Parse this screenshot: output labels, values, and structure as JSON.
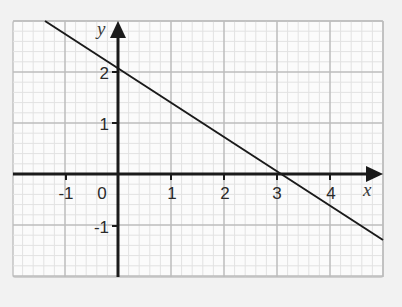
{
  "chart_data": {
    "type": "line",
    "title": "",
    "xlabel": "x",
    "ylabel": "y",
    "xlim": [
      -2,
      5
    ],
    "ylim": [
      -2,
      3
    ],
    "grid": true,
    "grid_minor_divisions": 5,
    "x_ticks": [
      "-1",
      "0",
      "1",
      "2",
      "3",
      "4"
    ],
    "y_ticks": [
      "2",
      "1",
      "-1"
    ],
    "series": [
      {
        "name": "line",
        "equation": "y = 2 - (2/3)x",
        "x": [
          -1.38,
          0,
          3,
          5
        ],
        "y": [
          2.92,
          2,
          0,
          -1.33
        ]
      }
    ],
    "legend": null
  },
  "labels": {
    "x_axis": "x",
    "y_axis": "y",
    "x_ticks": {
      "m1": "-1",
      "zero": "0",
      "p1": "1",
      "p2": "2",
      "p3": "3",
      "p4": "4"
    },
    "y_ticks": {
      "p2": "2",
      "p1": "1",
      "m1": "-1"
    }
  },
  "colors": {
    "background": "#f2f2f2",
    "plot_background": "#fbfbfb",
    "minor_grid": "#e2e2e2",
    "major_grid": "#bdbdbd",
    "axis": "#1a1a1a",
    "line": "#1a1a1a"
  }
}
